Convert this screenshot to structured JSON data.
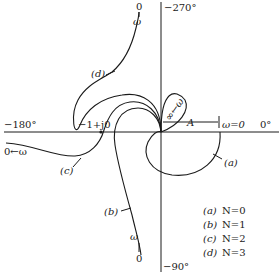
{
  "diagram": {
    "type": "nyquist-polar-plot",
    "axes": {
      "top_label": "−270°",
      "bottom_label": "−90°",
      "left_label": "−180°",
      "right_label": "0°"
    },
    "critical_point_label": "−1+j0",
    "annotations": {
      "A_label": "A",
      "omega_zero_label": "ω=0",
      "infinity_omega": "∞←ω",
      "d_end_zero": "0",
      "d_end_omega": "ω",
      "c_end": "0←ω",
      "b_end_omega": "ω",
      "b_end_zero": "0"
    },
    "curves": [
      {
        "id": "a",
        "tag": "(a)",
        "N": "0"
      },
      {
        "id": "b",
        "tag": "(b)",
        "N": "1"
      },
      {
        "id": "c",
        "tag": "(c)",
        "N": "2"
      },
      {
        "id": "d",
        "tag": "(d)",
        "N": "3"
      }
    ],
    "legend": [
      {
        "tag": "(a)",
        "text": "N=0"
      },
      {
        "tag": "(b)",
        "text": "N=1"
      },
      {
        "tag": "(c)",
        "text": "N=2"
      },
      {
        "tag": "(d)",
        "text": "N=3"
      }
    ]
  }
}
